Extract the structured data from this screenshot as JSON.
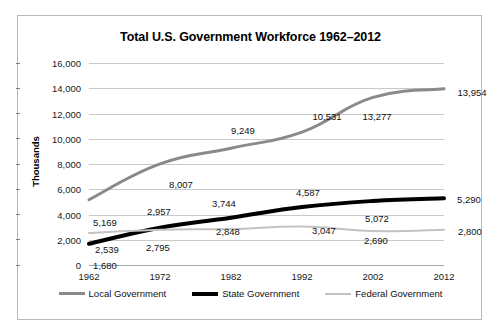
{
  "chart_data": {
    "type": "line",
    "title": "Total U.S. Government Workforce 1962–2012",
    "xlabel": "",
    "ylabel": "Thousands",
    "categories": [
      "1962",
      "1972",
      "1982",
      "1992",
      "2002",
      "2012"
    ],
    "x": [
      1962,
      1972,
      1982,
      1992,
      2002,
      2012
    ],
    "ylim": [
      0,
      16000
    ],
    "ytick_labels": [
      "0",
      "2,000",
      "4,000",
      "6,000",
      "8,000",
      "10,000",
      "12,000",
      "14,000",
      "16,000"
    ],
    "ytick_values": [
      0,
      2000,
      4000,
      6000,
      8000,
      10000,
      12000,
      14000,
      16000
    ],
    "grid": true,
    "legend_position": "bottom",
    "series": [
      {
        "name": "Local Government",
        "color": "#8a8a8a",
        "width": 3,
        "values": [
          5169,
          8007,
          9249,
          10531,
          13277,
          13954
        ],
        "labels": [
          "5,169",
          "8,007",
          "9,249",
          "10,531",
          "13,277",
          "13,954"
        ]
      },
      {
        "name": "State Government",
        "color": "#000000",
        "width": 4,
        "values": [
          1680,
          2957,
          3744,
          4587,
          5072,
          5290
        ],
        "labels": [
          "1,680",
          "2,957",
          "3,744",
          "4,587",
          "5,072",
          "5,290"
        ]
      },
      {
        "name": "Federal Government",
        "color": "#c2c2c2",
        "width": 2,
        "values": [
          2539,
          2795,
          2848,
          3047,
          2690,
          2800
        ],
        "labels": [
          "2,539",
          "2,795",
          "2,848",
          "3,047",
          "2,690",
          "2,800"
        ]
      }
    ],
    "point_labels": [
      {
        "series": "Local Government",
        "category": "1962",
        "text": "5,169",
        "px": 16,
        "py": 22
      },
      {
        "series": "Local Government",
        "category": "1972",
        "text": "8,007",
        "px": 21,
        "py": 20
      },
      {
        "series": "Local Government",
        "category": "1982",
        "text": "9,249",
        "px": 12,
        "py": -18
      },
      {
        "series": "Local Government",
        "category": "1992",
        "text": "10,531",
        "px": 25,
        "py": -16
      },
      {
        "series": "Local Government",
        "category": "2002",
        "text": "13,277",
        "px": 4,
        "py": 19
      },
      {
        "series": "Local Government",
        "category": "2012",
        "text": "13,954",
        "px": 28,
        "py": 3
      },
      {
        "series": "State Government",
        "category": "1962",
        "text": "1,680",
        "px": 16,
        "py": 21
      },
      {
        "series": "State Government",
        "category": "1972",
        "text": "2,957",
        "px": -1,
        "py": -17
      },
      {
        "series": "State Government",
        "category": "1982",
        "text": "3,744",
        "px": -7,
        "py": -15
      },
      {
        "series": "State Government",
        "category": "1992",
        "text": "4,587",
        "px": 6,
        "py": -15
      },
      {
        "series": "State Government",
        "category": "2002",
        "text": "5,072",
        "px": 4,
        "py": 17
      },
      {
        "series": "State Government",
        "category": "2012",
        "text": "5,290",
        "px": 25,
        "py": 1
      },
      {
        "series": "Federal Government",
        "category": "1962",
        "text": "2,539",
        "px": 18,
        "py": 16
      },
      {
        "series": "Federal Government",
        "category": "1972",
        "text": "2,795",
        "px": -2,
        "py": 17
      },
      {
        "series": "Federal Government",
        "category": "1982",
        "text": "2,848",
        "px": -3,
        "py": 2
      },
      {
        "series": "Federal Government",
        "category": "1992",
        "text": "3,047",
        "px": 22,
        "py": 3
      },
      {
        "series": "Federal Government",
        "category": "2002",
        "text": "2,690",
        "px": 3,
        "py": 9
      },
      {
        "series": "Federal Government",
        "category": "2012",
        "text": "2,800",
        "px": 26,
        "py": 1
      }
    ]
  }
}
